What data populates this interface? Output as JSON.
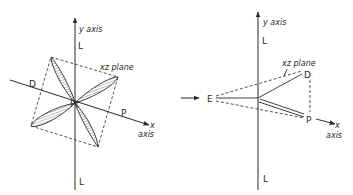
{
  "figure": {
    "left_panel": {
      "y_axis_label": "y axis",
      "l_top_label": "L",
      "l_bottom_label": "L",
      "x_axis_label_x": "x",
      "x_axis_label_axis": "axis",
      "plane_label": "xz plane",
      "d_label": "D",
      "p_label": "P",
      "center_label": "Pt"
    },
    "right_panel": {
      "y_axis_label": "y axis",
      "l_top_label": "L",
      "l_bottom_label": "L",
      "x_axis_label_x": "x",
      "x_axis_label_axis": "axis",
      "plane_label": "xz plane",
      "d_label": "D",
      "p_label": "P",
      "e_label": "E"
    },
    "colors": {
      "ink": "#2a2a2a",
      "background": "#ffffff"
    }
  }
}
